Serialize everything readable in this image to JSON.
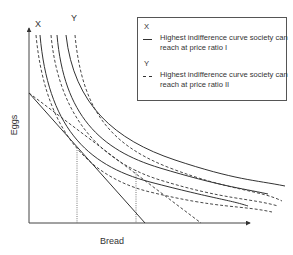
{
  "diagram": {
    "title": "",
    "axes": {
      "x_label": "Bread",
      "y_label": "Eggs"
    },
    "curve_labels": {
      "x": "X",
      "y": "Y"
    },
    "legend": {
      "items": [
        {
          "key": "X",
          "style": "solid",
          "text": "Highest indifference curve society can reach at price ratio I"
        },
        {
          "key": "Y",
          "style": "dashed",
          "text": "Highest indifference curve society can reach at price ratio II"
        }
      ],
      "x_key": "X",
      "x_text": "Highest indifference curve society can reach at price ratio I",
      "y_key": "Y",
      "y_text": "Highest indifference curve society can reach at price ratio II"
    },
    "elements": {
      "solid_indifference_curves": 3,
      "dashed_indifference_curves": 3,
      "budget_line_price_ratio_I": "solid, from Eggs intercept to Bread ~145px",
      "budget_line_price_ratio_II": "dashed, from Eggs intercept to Bread ~201px",
      "dotted_verticals": 2
    },
    "colors": {
      "line": "#333333",
      "background": "#ffffff"
    }
  }
}
